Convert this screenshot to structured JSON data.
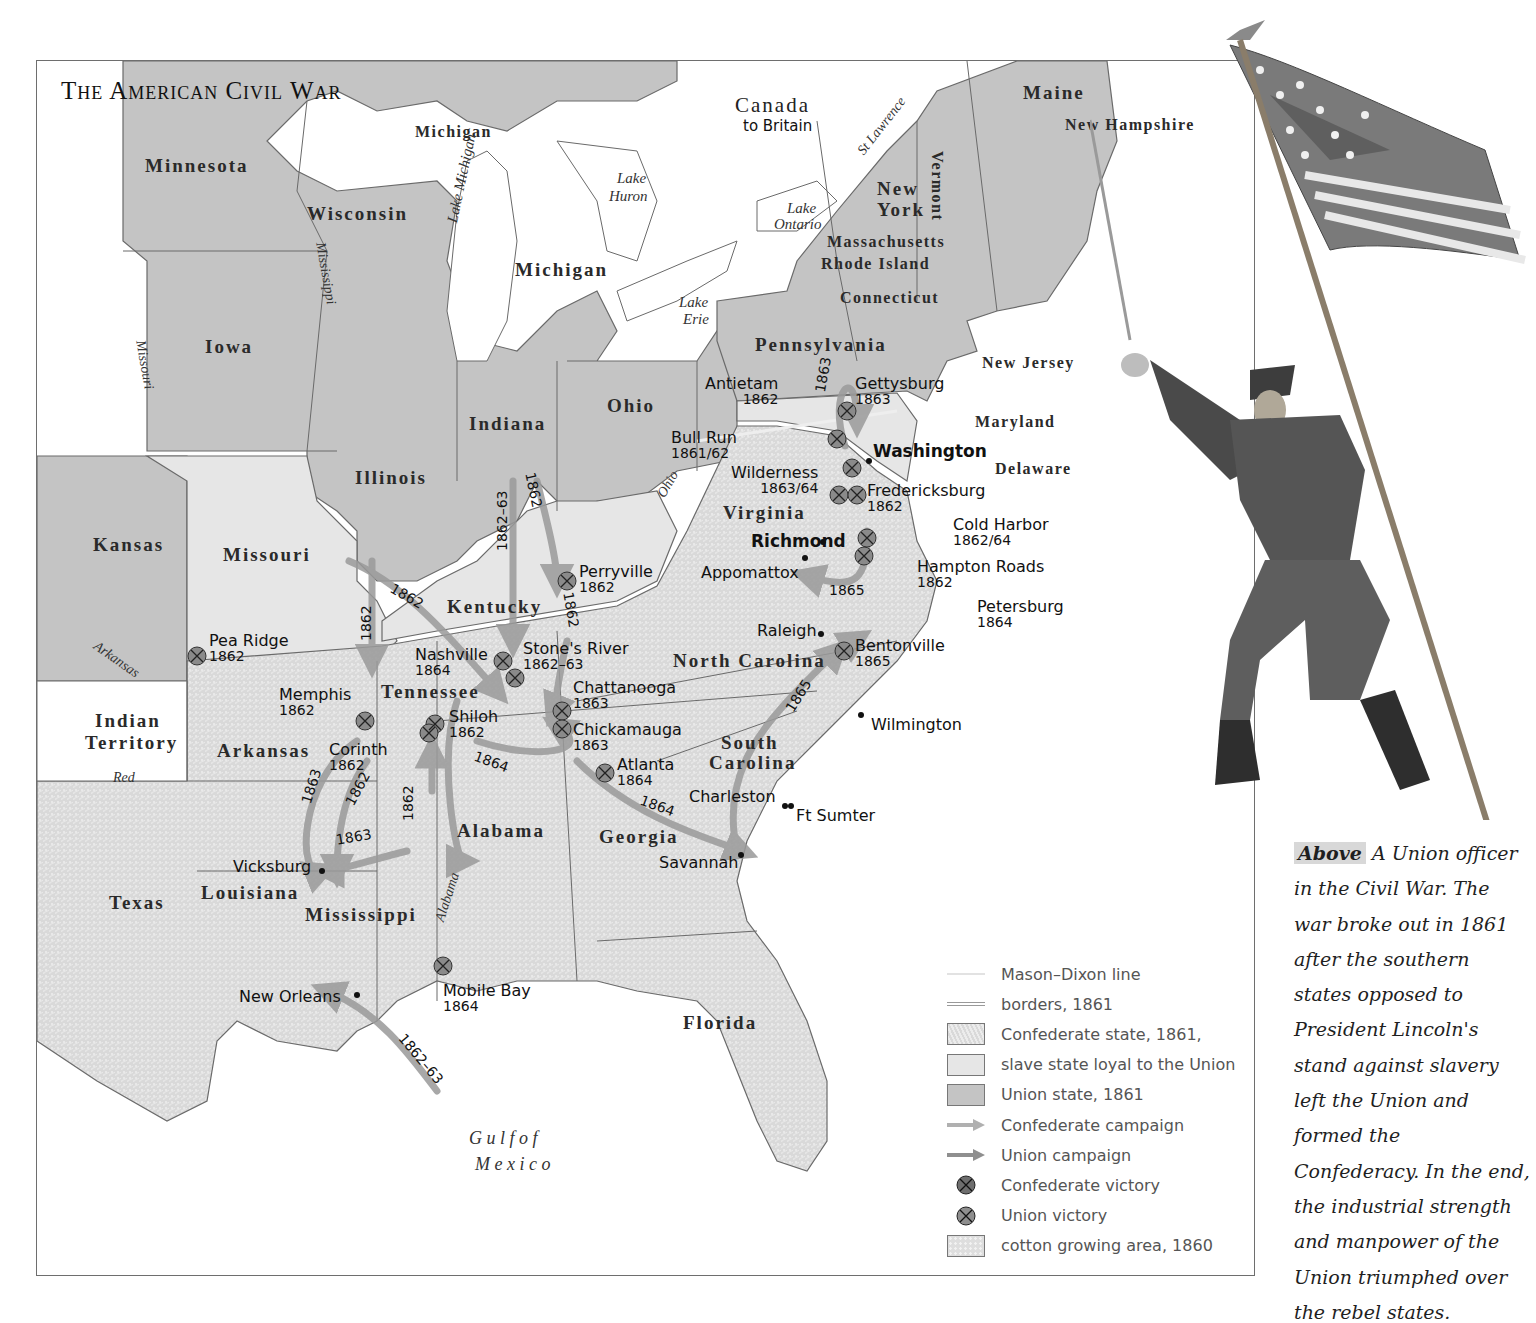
{
  "title": "The American Civil War",
  "colors": {
    "union_state": "#c4c4c4",
    "slave_state_loyal": "#e6e6e6",
    "confederate_state": "#d6d6d6",
    "water_background": "#ffffff",
    "campaign_arrow": "#9a9a9a",
    "battle_marker": "#8a8a8a",
    "border_line": "#6a6a6a"
  },
  "regions": {
    "canada": {
      "name": "Canada",
      "sub": "to Britain"
    },
    "union_states": [
      "Minnesota",
      "Wisconsin",
      "Michigan",
      "Iowa",
      "Illinois",
      "Indiana",
      "Ohio",
      "Pennsylvania",
      "New York",
      "Vermont",
      "Maine",
      "Kansas"
    ],
    "small_union_states": [
      "New Hampshire",
      "Massachusetts",
      "Rhode Island",
      "Connecticut",
      "New Jersey"
    ],
    "slave_states_loyal": [
      "Missouri",
      "Kentucky",
      "Maryland",
      "Delaware"
    ],
    "confederate_states": [
      "Virginia",
      "Tennessee",
      "North Carolina",
      "South Carolina",
      "Georgia",
      "Alabama",
      "Mississippi",
      "Arkansas",
      "Louisiana",
      "Texas",
      "Florida"
    ],
    "territories": [
      "Indian Territory"
    ],
    "michigan_upper": "Michigan"
  },
  "labels": {
    "minnesota": "Minnesota",
    "wisconsin": "Wisconsin",
    "michigan_up": "Michigan",
    "michigan": "Michigan",
    "iowa": "Iowa",
    "illinois": "Illinois",
    "indiana": "Indiana",
    "ohio": "Ohio",
    "pennsylvania": "Pennsylvania",
    "new_york_1": "New",
    "new_york_2": "York",
    "vermont": "Vermont",
    "maine": "Maine",
    "new_hampshire": "New Hampshire",
    "massachusetts": "Massachusetts",
    "rhode_island": "Rhode Island",
    "connecticut": "Connecticut",
    "new_jersey": "New Jersey",
    "maryland": "Maryland",
    "delaware": "Delaware",
    "kansas": "Kansas",
    "missouri": "Missouri",
    "kentucky": "Kentucky",
    "virginia": "Virginia",
    "tennessee": "Tennessee",
    "north_carolina": "North Carolina",
    "south_carolina_1": "South",
    "south_carolina_2": "Carolina",
    "georgia": "Georgia",
    "alabama": "Alabama",
    "mississippi": "Mississippi",
    "arkansas": "Arkansas",
    "louisiana": "Louisiana",
    "texas": "Texas",
    "florida": "Florida",
    "indian_territory_1": "Indian",
    "indian_territory_2": "Territory",
    "canada": "Canada",
    "canada_sub": "to Britain"
  },
  "water": {
    "lake_michigan": "Lake Michigan",
    "lake_huron_1": "Lake",
    "lake_huron_2": "Huron",
    "lake_ontario_1": "Lake",
    "lake_ontario_2": "Ontario",
    "lake_erie_1": "Lake",
    "lake_erie_2": "Erie",
    "gulf_1": "G u l f   o f",
    "gulf_2": "M e x i c o"
  },
  "rivers": {
    "mississippi": "Mississippi",
    "missouri": "Missouri",
    "ohio": "Ohio",
    "st_lawrence": "St Lawrence",
    "arkansas": "Arkansas",
    "red": "Red",
    "alabama": "Alabama"
  },
  "cities": {
    "washington": "Washington",
    "richmond": "Richmond",
    "appomattox": "Appomattox",
    "raleigh": "Raleigh",
    "wilmington": "Wilmington",
    "charleston": "Charleston",
    "ft_sumter": "Ft Sumter",
    "savannah": "Savannah",
    "vicksburg": "Vicksburg",
    "new_orleans": "New Orleans"
  },
  "battles": [
    {
      "name": "Gettysburg",
      "year": "1863",
      "victor": "union"
    },
    {
      "name": "Antietam",
      "year": "1862",
      "victor": "union"
    },
    {
      "name": "Bull Run",
      "year": "1861/62",
      "victor": "confederate"
    },
    {
      "name": "Wilderness",
      "year": "1863/64",
      "victor": "confederate"
    },
    {
      "name": "Fredericksburg",
      "year": "1862",
      "victor": "confederate"
    },
    {
      "name": "Cold Harbor",
      "year": "1862/64",
      "victor": "confederate"
    },
    {
      "name": "Hampton Roads",
      "year": "1862",
      "victor": "union"
    },
    {
      "name": "Petersburg",
      "year": "1864",
      "victor": "union"
    },
    {
      "name": "Perryville",
      "year": "1862",
      "victor": "union"
    },
    {
      "name": "Pea Ridge",
      "year": "1862",
      "victor": "union"
    },
    {
      "name": "Nashville",
      "year": "1864",
      "victor": "union"
    },
    {
      "name": "Stone's River",
      "year": "1862–63",
      "victor": "union"
    },
    {
      "name": "Chattanooga",
      "year": "1863",
      "victor": "union"
    },
    {
      "name": "Chickamauga",
      "year": "1863",
      "victor": "confederate"
    },
    {
      "name": "Memphis",
      "year": "1862",
      "victor": "union"
    },
    {
      "name": "Shiloh",
      "year": "1862",
      "victor": "union"
    },
    {
      "name": "Corinth",
      "year": "1862",
      "victor": "union"
    },
    {
      "name": "Atlanta",
      "year": "1864",
      "victor": "union"
    },
    {
      "name": "Bentonville",
      "year": "1865",
      "victor": "union"
    },
    {
      "name": "Mobile Bay",
      "year": "1864",
      "victor": "union"
    }
  ],
  "campaign_years": {
    "gettysburg": "1863",
    "appomattox": "1865",
    "bentonville": "1865",
    "indiana_a": "1862–63",
    "indiana_b": "1862",
    "kentucky": "1862",
    "missouri_a": "1862",
    "missouri_b": "1862",
    "vicksburg_a": "1863",
    "vicksburg_b": "1862",
    "vicksburg_c": "1862",
    "vicksburg_d": "1863",
    "atlanta_a": "1864",
    "atlanta_b": "1864",
    "new_orleans": "1862–63"
  },
  "legend": {
    "items": [
      {
        "label": "Mason–Dixon line",
        "swatch": "mason-dixon-line"
      },
      {
        "label": "borders, 1861",
        "swatch": "borders-line"
      },
      {
        "label": "Confederate state, 1861,",
        "swatch": "confederate-state"
      },
      {
        "label": "slave state loyal to the Union",
        "swatch": "slave-state-loyal"
      },
      {
        "label": "Union state, 1861",
        "swatch": "union-state"
      },
      {
        "label": "Confederate campaign",
        "swatch": "confederate-campaign-arrow"
      },
      {
        "label": "Union campaign",
        "swatch": "union-campaign-arrow"
      },
      {
        "label": "Confederate victory",
        "swatch": "confederate-victory-marker"
      },
      {
        "label": "Union victory",
        "swatch": "union-victory-marker"
      },
      {
        "label": "cotton growing area, 1860",
        "swatch": "cotton-area"
      }
    ]
  },
  "caption": {
    "lead": "Above",
    "text": "A Union officer in the Civil War. The war broke out in 1861 after the southern states opposed to President Lincoln's stand against slavery left the Union and formed the Confederacy. In the end, the industrial strength and manpower of the Union triumphed over the rebel states."
  },
  "illustration": {
    "subject": "Union officer raising a sword and carrying the US flag"
  }
}
